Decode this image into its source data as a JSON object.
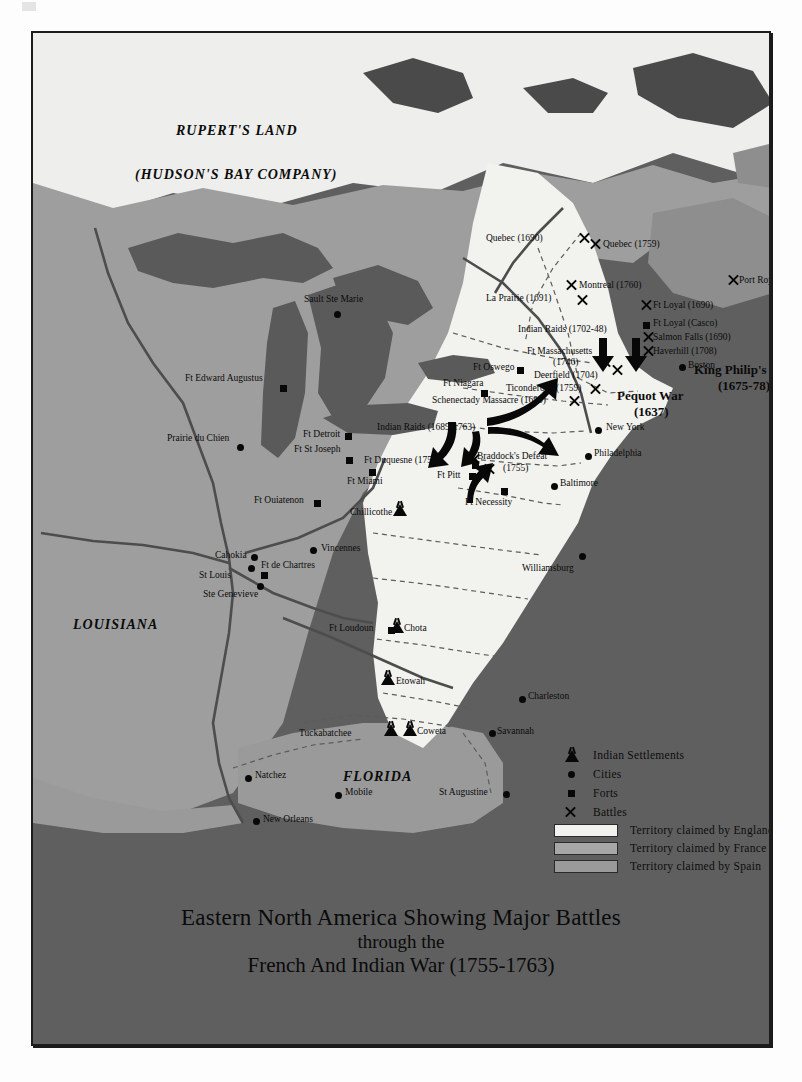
{
  "map": {
    "title_lines": [
      "Eastern North America Showing Major Battles",
      "through the",
      "French And Indian War (1755-1763)"
    ],
    "regions": [
      {
        "name": "RUPERT'S LAND",
        "x": 143,
        "y": 92
      },
      {
        "name": "(HUDSON'S BAY COMPANY)",
        "x": 102,
        "y": 136
      },
      {
        "name": "LOUISIANA",
        "x": 72,
        "y": 586
      },
      {
        "name": "FLORIDA",
        "x": 340,
        "y": 739
      }
    ],
    "cities": [
      {
        "name": "Sault Ste Marie",
        "x": 306,
        "y": 262,
        "mx": 301,
        "my": 278,
        "anchor": "right"
      },
      {
        "name": "Prairie du Chien",
        "x": 141,
        "y": 403,
        "mx": 204,
        "my": 411,
        "anchor": "right"
      },
      {
        "name": "Cahokia",
        "x": 182,
        "y": 519,
        "mx": 218,
        "my": 521,
        "anchor": "right"
      },
      {
        "name": "St Louis",
        "x": 166,
        "y": 540,
        "mx": 215,
        "my": 530,
        "anchor": "right"
      },
      {
        "name": "Ste Genevieve",
        "x": 176,
        "y": 558,
        "mx": 224,
        "my": 550,
        "anchor": "right"
      },
      {
        "name": "Vincennes",
        "x": 288,
        "y": 512,
        "mx": 279,
        "my": 516,
        "anchor": "left"
      },
      {
        "name": "Natchez",
        "x": 222,
        "y": 738,
        "mx": 213,
        "my": 742,
        "anchor": "left"
      },
      {
        "name": "Mobile",
        "x": 312,
        "y": 756,
        "mx": 303,
        "my": 759,
        "anchor": "left"
      },
      {
        "name": "New Orleans",
        "x": 230,
        "y": 783,
        "mx": 221,
        "my": 785,
        "anchor": "left"
      },
      {
        "name": "St Augustine",
        "x": 419,
        "y": 757,
        "mx": 470,
        "my": 758,
        "anchor": "right"
      },
      {
        "name": "Savannah",
        "x": 464,
        "y": 695,
        "mx": 456,
        "my": 697,
        "anchor": "left"
      },
      {
        "name": "Charleston",
        "x": 495,
        "y": 661,
        "mx": 487,
        "my": 663,
        "anchor": "left"
      },
      {
        "name": "Williamsburg",
        "x": 489,
        "y": 531,
        "mx": 546,
        "my": 520,
        "anchor": "right"
      },
      {
        "name": "Baltimore",
        "x": 524,
        "y": 452,
        "mx": 519,
        "my": 450,
        "anchor": "left"
      },
      {
        "name": "Philadelphia",
        "x": 561,
        "y": 418,
        "mx": 553,
        "my": 420,
        "anchor": "left"
      },
      {
        "name": "New York",
        "x": 572,
        "y": 394,
        "mx": 564,
        "my": 396,
        "anchor": "left"
      },
      {
        "name": "Boston",
        "x": 655,
        "y": 330,
        "mx": 648,
        "my": 331,
        "anchor": "left"
      }
    ],
    "forts": [
      {
        "name": "Ft Edward Augustus",
        "x": 148,
        "y": 337,
        "mx": 247,
        "my": 352,
        "anchor": "right"
      },
      {
        "name": "Ft Detroit",
        "x": 275,
        "y": 399,
        "mx": 312,
        "my": 400,
        "anchor": "right"
      },
      {
        "name": "Ft St Joseph",
        "x": 276,
        "y": 415,
        "mx": 313,
        "my": 424,
        "anchor": "right"
      },
      {
        "name": "Ft Miami",
        "x": 318,
        "y": 443,
        "mx": 336,
        "my": 437,
        "anchor": "right"
      },
      {
        "name": "Ft Ouiatenon",
        "x": 228,
        "y": 464,
        "mx": 281,
        "my": 467,
        "anchor": "right"
      },
      {
        "name": "Ft de Chartres",
        "x": 204,
        "y": 528,
        "mx": 228,
        "my": 539,
        "anchor": "left"
      },
      {
        "name": "Ft Loudoun",
        "x": 300,
        "y": 591,
        "mx": 355,
        "my": 594,
        "anchor": "right"
      },
      {
        "name": "Ft Niagara",
        "x": 414,
        "y": 347,
        "mx": 448,
        "my": 357,
        "anchor": "right"
      },
      {
        "name": "Ft Oswego",
        "x": 440,
        "y": 331,
        "mx": 484,
        "my": 334,
        "anchor": "right"
      },
      {
        "name": "Ft Duquesne (1758)",
        "x": 363,
        "y": 424,
        "mx": 439,
        "my": 429,
        "anchor": "right"
      },
      {
        "name": "Ft Pitt",
        "x": 404,
        "y": 438,
        "mx": 436,
        "my": 440,
        "anchor": "right"
      },
      {
        "name": "Ft Necessity",
        "x": 435,
        "y": 463,
        "mx": 468,
        "my": 455,
        "anchor": "right"
      },
      {
        "name": "Ft Loyal (Casco)",
        "x": 616,
        "y": 287,
        "mx": 611,
        "my": 289,
        "anchor": "left"
      }
    ],
    "settlements": [
      {
        "name": "Chillicothe",
        "x": 321,
        "y": 477,
        "mx": 363,
        "my": 471,
        "anchor": "right"
      },
      {
        "name": "Chota",
        "x": 368,
        "y": 591,
        "mx": 362,
        "my": 588,
        "anchor": "left"
      },
      {
        "name": "Etowah",
        "x": 366,
        "y": 645,
        "mx": 352,
        "my": 640,
        "anchor": "left"
      },
      {
        "name": "Tuckabatchee",
        "x": 298,
        "y": 699,
        "mx": 355,
        "my": 693,
        "anchor": "right"
      },
      {
        "name": "Coweta",
        "x": 380,
        "y": 697,
        "mx": 373,
        "my": 691,
        "anchor": "left"
      }
    ],
    "battles": [
      {
        "name": "Quebec (1690)",
        "x": 485,
        "y": 205,
        "mx": 545,
        "my": 205
      },
      {
        "name": "Quebec (1759)",
        "x": 568,
        "y": 212,
        "mx": 559,
        "my": 210
      },
      {
        "name": "Montreal (1760)",
        "x": 544,
        "y": 252,
        "mx": 534,
        "my": 251
      },
      {
        "name": "La Prairie (1691)",
        "x": 477,
        "y": 265,
        "mx": 546,
        "my": 265
      },
      {
        "name": "Port Royal (1710)",
        "x": 705,
        "y": 247,
        "mx": 696,
        "my": 246
      },
      {
        "name": "Ft Loyal (1690)",
        "x": 617,
        "y": 271,
        "mx": 609,
        "my": 270
      },
      {
        "name": "Indian Raids (1702-48)",
        "x": 516,
        "y": 297,
        "mx": 0,
        "my": 0
      },
      {
        "name": "Salmon Falls (1690)",
        "x": 619,
        "y": 303,
        "mx": 611,
        "my": 303
      },
      {
        "name": "Ft Massachusetts",
        "x": 498,
        "y": 319,
        "mx": 0,
        "my": 0
      },
      {
        "name": "(1746)",
        "x": 524,
        "y": 330,
        "mx": 568,
        "my": 327
      },
      {
        "name": "Haverhill (1708)",
        "x": 619,
        "y": 317,
        "mx": 611,
        "my": 317
      },
      {
        "name": "Deerfield (1704)",
        "x": 534,
        "y": 341,
        "mx": 580,
        "my": 335
      },
      {
        "name": "King Philip's War",
        "x": 667,
        "y": 336,
        "mx": 0,
        "my": 0
      },
      {
        "name": "(1675-78)",
        "x": 684,
        "y": 349,
        "mx": 0,
        "my": 0
      },
      {
        "name": "Ticonderoga (1759)",
        "x": 475,
        "y": 355,
        "mx": 558,
        "my": 354
      },
      {
        "name": "Pequot War",
        "x": 590,
        "y": 361,
        "mx": 0,
        "my": 0
      },
      {
        "name": "(1637)",
        "x": 601,
        "y": 375,
        "mx": 0,
        "my": 0
      },
      {
        "name": "Schenectady Massacre (1690)",
        "x": 403,
        "y": 369,
        "mx": 537,
        "my": 366
      },
      {
        "name": "Indian Raids (1689-1763)",
        "x": 380,
        "y": 394,
        "mx": 0,
        "my": 0
      },
      {
        "name": "Braddock's Defeat",
        "x": 464,
        "y": 423,
        "mx": 452,
        "my": 434
      },
      {
        "name": "(1755)",
        "x": 483,
        "y": 435,
        "mx": 0,
        "my": 0
      }
    ],
    "battle_marks": [
      {
        "x": 545,
        "y": 205
      },
      {
        "x": 559,
        "y": 210
      },
      {
        "x": 534,
        "y": 251
      },
      {
        "x": 546,
        "y": 265
      },
      {
        "x": 696,
        "y": 246
      },
      {
        "x": 609,
        "y": 270
      },
      {
        "x": 611,
        "y": 303
      },
      {
        "x": 611,
        "y": 317
      },
      {
        "x": 568,
        "y": 327
      },
      {
        "x": 580,
        "y": 335
      },
      {
        "x": 558,
        "y": 354
      },
      {
        "x": 537,
        "y": 366
      },
      {
        "x": 452,
        "y": 434
      },
      {
        "x": 437,
        "y": 424
      }
    ]
  },
  "legend": {
    "symbol_rows": [
      {
        "icon": "tepee-icon",
        "label": "Indian Settlements"
      },
      {
        "icon": "circle-icon",
        "label": "Cities"
      },
      {
        "icon": "square-icon",
        "label": "Forts"
      },
      {
        "icon": "cross-icon",
        "label": "Battles"
      }
    ],
    "swatch_rows": [
      {
        "label": "Territory claimed by England",
        "color": "#f2f2ef"
      },
      {
        "label": "Territory claimed by France",
        "color": "#a7a7a7"
      },
      {
        "label": "Territory claimed by Spain",
        "color": "#9a9a9a"
      }
    ]
  }
}
